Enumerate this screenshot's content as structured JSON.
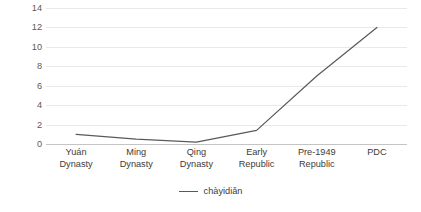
{
  "chart_data": {
    "type": "line",
    "title": "",
    "xlabel": "",
    "ylabel": "Frequency peronemill.characters",
    "categories": [
      "Yuán Dynasty",
      "Ming Dynasty",
      "Qing Dynasty",
      "Early Republic",
      "Pre-1949 Republic",
      "PDC"
    ],
    "category_lines": [
      [
        "Yuán",
        "Dynasty"
      ],
      [
        "Ming",
        "Dynasty"
      ],
      [
        "Qing",
        "Dynasty"
      ],
      [
        "Early",
        "Republic"
      ],
      [
        "Pre-1949",
        "Republic"
      ],
      [
        "PDC",
        ""
      ]
    ],
    "series": [
      {
        "name": "chàyidiǎn",
        "values": [
          1.0,
          0.5,
          0.2,
          1.4,
          7.0,
          12.0
        ],
        "color": "#595959"
      }
    ],
    "ylim": [
      0,
      14
    ],
    "yticks": [
      0,
      2,
      4,
      6,
      8,
      10,
      12,
      14
    ],
    "ytick_labels": [
      "0",
      "2",
      "4",
      "6",
      "8",
      "10",
      "12",
      "14"
    ],
    "grid": true,
    "legend": {
      "position": "bottom-center",
      "entries": [
        "chàyidiǎn"
      ]
    },
    "colors": {
      "line": "#595959",
      "gridline": "#e9e9e9",
      "baseline": "#c4c4c4",
      "text": "#3b3b3b",
      "background": "#ffffff"
    }
  }
}
